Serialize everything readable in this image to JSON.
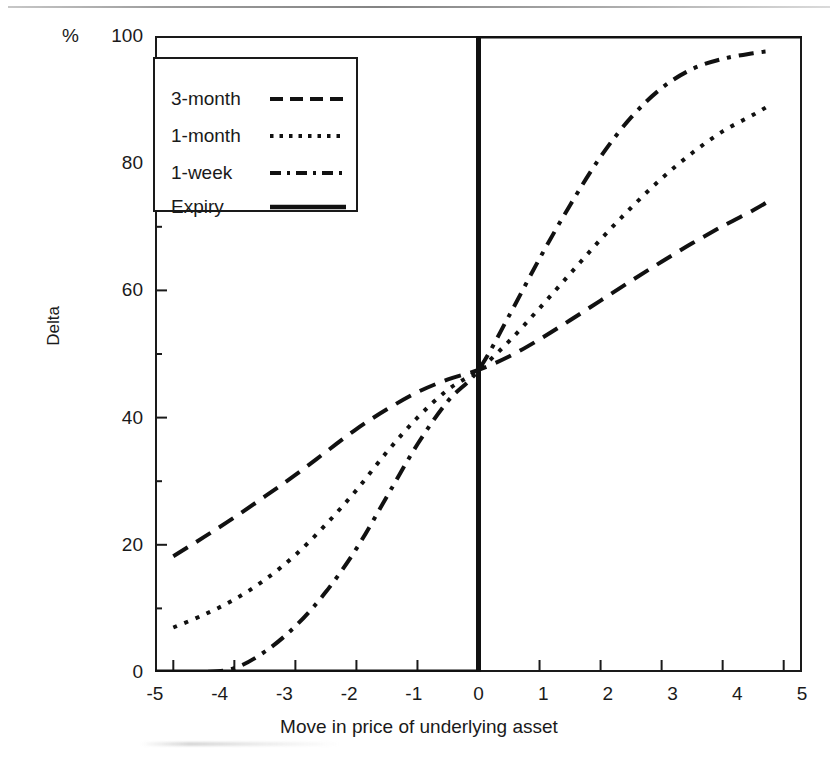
{
  "figure": {
    "y_unit_label": "%",
    "x_axis_title": "Move in price of underlying asset",
    "y_axis_title": "Delta"
  },
  "legend": {
    "entries": [
      {
        "label": "3-month",
        "style": "dashed"
      },
      {
        "label": "1-month",
        "style": "dotted"
      },
      {
        "label": "1-week",
        "style": "dash-dot"
      },
      {
        "label": "Expiry",
        "style": "solid"
      }
    ]
  },
  "chart_data": {
    "type": "line",
    "title": "",
    "xlabel": "Move in price of underlying asset",
    "ylabel": "Delta",
    "y_unit": "%",
    "xlim": [
      -5.3,
      5.3
    ],
    "ylim": [
      0,
      100
    ],
    "grid": false,
    "legend_position": "top-left inside plot",
    "x_ticks": [
      "-5",
      "-4",
      "-3",
      "-2",
      "-1",
      "0",
      "1",
      "2",
      "3",
      "4",
      "5"
    ],
    "x_tick_values": [
      -5,
      -4,
      -3,
      -2,
      -1,
      0,
      1,
      2,
      3,
      4,
      5
    ],
    "y_ticks": [
      "0",
      "20",
      "40",
      "60",
      "80",
      "100"
    ],
    "y_tick_values": [
      0,
      20,
      40,
      60,
      80,
      100
    ],
    "y_minor_ticks": [
      10,
      30,
      50,
      70,
      90
    ],
    "crossing_point": {
      "x": 0,
      "y": 47.5
    },
    "x": [
      -5,
      -4.5,
      -4,
      -3.5,
      -3,
      -2.5,
      -2,
      -1.5,
      -1,
      -0.5,
      0,
      0.5,
      1,
      1.5,
      2,
      2.5,
      3,
      3.5,
      4,
      4.5,
      4.75
    ],
    "series": [
      {
        "name": "3-month",
        "style": "dashed",
        "values": [
          18.2,
          21.2,
          24.3,
          27.6,
          31.0,
          34.6,
          38.2,
          41.3,
          44.0,
          46.0,
          47.5,
          49.6,
          52.3,
          55.3,
          58.4,
          61.5,
          64.5,
          67.4,
          70.1,
          72.6,
          74.0
        ]
      },
      {
        "name": "1-month",
        "style": "dotted",
        "values": [
          7.0,
          9.0,
          11.4,
          14.5,
          18.4,
          23.2,
          28.6,
          34.6,
          40.0,
          44.4,
          47.5,
          52.0,
          57.2,
          62.6,
          68.0,
          73.0,
          77.6,
          81.6,
          85.0,
          87.6,
          89.0
        ]
      },
      {
        "name": "1-week",
        "style": "dash-dot",
        "values": [
          0.0,
          0.0,
          0.6,
          3.2,
          7.2,
          12.6,
          19.4,
          27.6,
          35.8,
          42.6,
          47.5,
          56.0,
          65.0,
          73.4,
          81.0,
          87.2,
          91.8,
          94.8,
          96.4,
          97.3,
          97.6
        ]
      },
      {
        "name": "Expiry",
        "style": "solid",
        "description": "Step function: 0 for x<0, vertical jump at x=0, 100 for x>0",
        "points": [
          [
            -5.3,
            0
          ],
          [
            0,
            0
          ],
          [
            0,
            100
          ],
          [
            5.3,
            100
          ]
        ]
      }
    ]
  }
}
